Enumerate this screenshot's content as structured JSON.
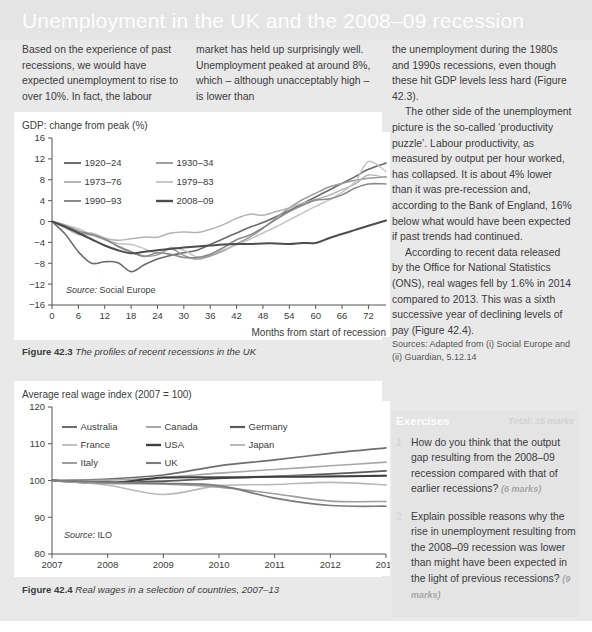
{
  "header": {
    "title": "Unemployment in the UK and the 2008–09 recession"
  },
  "columns": {
    "col1_p1": "Based on the experience of past recessions, we would have expected unemployment to rise to over 10%. In fact, the labour",
    "col2_p1": "market has held up surprisingly well. Unemployment peaked at around 8%, which – although unacceptably high – is lower than",
    "col3_p1": "the unemployment during the 1980s and 1990s recessions, even though these hit GDP levels less hard (Figure 42.3).",
    "col3_p2": "The other side of the unemployment picture is the so-called ‘productivity puzzle’. Labour productivity, as measured by output per hour worked, has collapsed. It is about 4% lower than it was pre-recession and, according to the Bank of England, 16% below what would have been expected if past trends had continued.",
    "col3_p3": "According to recent data released by the Office for National Statistics (ONS), real wages fell by 1.6% in 2014 compared to 2013. This was a sixth successive year of declining levels of pay (Figure 42.4).",
    "col3_sources": "Sources: Adapted from (i) Social Europe and (ii) Guardian, 5.12.14"
  },
  "exercises": {
    "title": "Exercises",
    "total": "Total: 15 marks",
    "items": [
      {
        "number": "1",
        "text": "How do you think that the output gap resulting from the 2008–09 recession compared with that of earlier recessions?",
        "marks": "(6 marks)"
      },
      {
        "number": "2",
        "text": "Explain possible reasons why the rise in unemployment resulting from the 2008–09 recession was lower than might have been expected in the light of previous recessions?",
        "marks": "(9 marks)"
      }
    ]
  },
  "figures": {
    "fig1": {
      "caption_label": "Figure 42.3",
      "caption_text": "The profiles of recent recessions in the UK"
    },
    "fig2": {
      "caption_label": "Figure 42.4",
      "caption_text": "Real wages in a selection of countries, 2007–13"
    }
  },
  "chart_data": [
    {
      "type": "line",
      "id": "recession-profiles",
      "title": "",
      "ylabel": "GDP: change from peak (%)",
      "xlabel": "Months from start of recession",
      "source": "Source: Social Europe",
      "grid": false,
      "legend_position": "inside-top-left",
      "xlim": [
        0,
        76
      ],
      "ylim": [
        -16,
        16
      ],
      "xticks": [
        0,
        6,
        12,
        18,
        24,
        30,
        36,
        42,
        48,
        54,
        60,
        66,
        72
      ],
      "yticks": [
        -16,
        -12,
        -8,
        -4,
        0,
        4,
        8,
        12,
        16
      ],
      "x": [
        0,
        3,
        6,
        9,
        12,
        15,
        18,
        21,
        24,
        27,
        30,
        33,
        36,
        39,
        42,
        45,
        48,
        51,
        54,
        57,
        60,
        63,
        66,
        69,
        72,
        76
      ],
      "series": [
        {
          "name": "1920–24",
          "color": "#6b6b6b",
          "width": 1.6,
          "values": [
            0,
            -2.4,
            -5.8,
            -8.0,
            -7.7,
            -7.9,
            -9.6,
            -8.3,
            -7.2,
            -6.5,
            -6.0,
            -5.5,
            -4.4,
            -3.3,
            -2.2,
            -1.1,
            -0.2,
            0.9,
            2.1,
            3.4,
            4.7,
            6.0,
            7.3,
            8.6,
            10.0,
            11.2
          ]
        },
        {
          "name": "1930–34",
          "color": "#9a9a9a",
          "width": 1.5,
          "values": [
            0,
            -1.0,
            -2.1,
            -2.6,
            -3.2,
            -4.8,
            -5.9,
            -6.6,
            -6.4,
            -5.2,
            -6.5,
            -7.2,
            -6.6,
            -5.6,
            -4.3,
            -3.0,
            -1.3,
            0.7,
            2.6,
            4.2,
            5.4,
            6.6,
            7.3,
            7.9,
            8.3,
            8.6
          ]
        },
        {
          "name": "1973–76",
          "color": "#b3b3b3",
          "width": 1.5,
          "values": [
            0,
            -1.2,
            -2.5,
            -2.2,
            -3.2,
            -3.6,
            -3.3,
            -3.0,
            -3.0,
            -2.2,
            -2.0,
            -2.1,
            -1.5,
            -0.6,
            0.6,
            1.4,
            1.2,
            1.9,
            2.6,
            3.5,
            4.2,
            5.0,
            6.1,
            7.2,
            8.9,
            8.4
          ]
        },
        {
          "name": "1979–83",
          "color": "#c4c4c4",
          "width": 1.5,
          "values": [
            0,
            -0.6,
            -1.4,
            -2.5,
            -3.5,
            -4.2,
            -4.4,
            -5.2,
            -6.1,
            -5.0,
            -5.5,
            -6.8,
            -6.2,
            -5.4,
            -4.5,
            -3.4,
            -2.2,
            -1.0,
            0.3,
            1.6,
            2.9,
            4.1,
            5.6,
            7.6,
            11.5,
            9.6
          ]
        },
        {
          "name": "1990–93",
          "color": "#8a8a8a",
          "width": 1.6,
          "values": [
            0,
            -0.8,
            -1.8,
            -2.5,
            -3.4,
            -4.7,
            -5.8,
            -6.7,
            -6.0,
            -6.3,
            -6.9,
            -6.9,
            -6.3,
            -5.0,
            -3.5,
            -2.6,
            -1.2,
            0.4,
            1.9,
            3.1,
            4.1,
            4.3,
            5.1,
            6.4,
            7.2,
            7.2
          ]
        },
        {
          "name": "2008–09",
          "color": "#4d4d4d",
          "width": 2.0,
          "values": [
            0,
            -1.0,
            -2.2,
            -3.4,
            -4.6,
            -5.5,
            -6.1,
            -5.8,
            -5.5,
            -5.2,
            -5.0,
            -4.8,
            -4.6,
            -4.4,
            -4.3,
            -4.3,
            -4.2,
            -4.2,
            -4.3,
            -4.1,
            -4.1,
            -3.2,
            -2.4,
            -1.6,
            -0.8,
            0.2
          ]
        }
      ]
    },
    {
      "type": "line",
      "id": "real-wage-index",
      "title": "",
      "ylabel": "Average real wage index (2007 = 100)",
      "xlabel": "",
      "source": "Source: ILO",
      "grid": false,
      "legend_position": "inside-top-left",
      "xlim": [
        2007,
        2013
      ],
      "ylim": [
        80,
        120
      ],
      "xticks": [
        2007,
        2008,
        2009,
        2010,
        2011,
        2012,
        2013
      ],
      "yticks": [
        80,
        90,
        100,
        110,
        120
      ],
      "x": [
        2007,
        2008,
        2009,
        2010,
        2011,
        2012,
        2013
      ],
      "series": [
        {
          "name": "Australia",
          "color": "#6e6e6e",
          "width": 1.7,
          "values": [
            100,
            100.4,
            101.5,
            104.0,
            105.6,
            107.4,
            108.9
          ]
        },
        {
          "name": "Canada",
          "color": "#a8a8a8",
          "width": 1.6,
          "values": [
            100,
            100.1,
            100.8,
            102.0,
            103.0,
            104.0,
            105.0
          ]
        },
        {
          "name": "Germany",
          "color": "#5a5a5a",
          "width": 1.8,
          "values": [
            100,
            99.6,
            99.8,
            100.6,
            101.1,
            101.8,
            102.6
          ]
        },
        {
          "name": "France",
          "color": "#c0c0c0",
          "width": 1.6,
          "values": [
            100,
            99.4,
            100.6,
            101.0,
            101.1,
            101.2,
            101.4
          ]
        },
        {
          "name": "USA",
          "color": "#3f3f3f",
          "width": 2.0,
          "values": [
            100,
            99.3,
            100.8,
            100.8,
            101.0,
            101.1,
            101.3
          ]
        },
        {
          "name": "Japan",
          "color": "#b9b9b9",
          "width": 1.6,
          "values": [
            100,
            98.7,
            96.2,
            98.6,
            98.9,
            99.5,
            98.8
          ]
        },
        {
          "name": "Italy",
          "color": "#9e9e9e",
          "width": 1.6,
          "values": [
            100,
            99.2,
            99.0,
            98.2,
            96.4,
            94.4,
            94.3
          ]
        },
        {
          "name": "UK",
          "color": "#7b7b7b",
          "width": 1.7,
          "values": [
            100,
            99.5,
            99.2,
            98.6,
            95.2,
            93.2,
            93.0
          ]
        }
      ]
    }
  ]
}
